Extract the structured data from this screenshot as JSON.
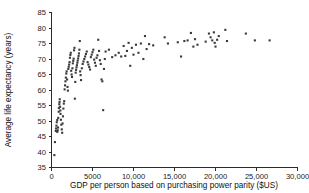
{
  "chart_data": {
    "type": "scatter",
    "title": "",
    "xlabel": "GDP per person based on purchasing power parity ($US)",
    "ylabel": "Average life expectancy (years)",
    "xlim": [
      0,
      30000
    ],
    "ylim": [
      35,
      85
    ],
    "grid": false,
    "legend": null,
    "xticks": [
      0,
      5000,
      10000,
      15000,
      20000,
      25000,
      30000
    ],
    "xticklabels": [
      "0",
      "5000",
      "10,000",
      "15,000",
      "20,000",
      "25,000",
      "30,000"
    ],
    "yticks": [
      35,
      40,
      45,
      50,
      55,
      60,
      65,
      70,
      75,
      80,
      85
    ],
    "yticklabels": [
      "35",
      "40",
      "45",
      "50",
      "55",
      "60",
      "65",
      "70",
      "75",
      "80",
      "85"
    ],
    "marker": {
      "shape": "square",
      "color": "#3a3a3a",
      "size_px": 2.1
    },
    "series": [
      {
        "name": "Countries",
        "points": [
          [
            350,
            39.0
          ],
          [
            420,
            43.2
          ],
          [
            520,
            46.8
          ],
          [
            560,
            47.6
          ],
          [
            600,
            48.5
          ],
          [
            640,
            49.6
          ],
          [
            700,
            50.3
          ],
          [
            700,
            46.5
          ],
          [
            760,
            47.0
          ],
          [
            800,
            47.9
          ],
          [
            820,
            51.0
          ],
          [
            880,
            53.0
          ],
          [
            900,
            54.2
          ],
          [
            950,
            55.4
          ],
          [
            980,
            56.1
          ],
          [
            1000,
            57.0
          ],
          [
            1050,
            54.6
          ],
          [
            1080,
            53.4
          ],
          [
            1100,
            52.3
          ],
          [
            1150,
            50.4
          ],
          [
            1200,
            48.8
          ],
          [
            1250,
            47.3
          ],
          [
            1300,
            46.2
          ],
          [
            1350,
            49.2
          ],
          [
            1400,
            51.5
          ],
          [
            1450,
            54.0
          ],
          [
            1500,
            55.6
          ],
          [
            1550,
            56.4
          ],
          [
            1600,
            60.2
          ],
          [
            1650,
            61.5
          ],
          [
            1700,
            62.8
          ],
          [
            1750,
            64.0
          ],
          [
            1800,
            65.3
          ],
          [
            1850,
            66.0
          ],
          [
            1900,
            63.4
          ],
          [
            1950,
            61.0
          ],
          [
            2000,
            59.8
          ],
          [
            2050,
            66.8
          ],
          [
            2100,
            67.5
          ],
          [
            2150,
            68.2
          ],
          [
            2200,
            69.0
          ],
          [
            2250,
            70.4
          ],
          [
            2300,
            71.3
          ],
          [
            2350,
            72.0
          ],
          [
            2400,
            66.2
          ],
          [
            2450,
            65.0
          ],
          [
            2500,
            64.2
          ],
          [
            2550,
            67.0
          ],
          [
            2600,
            68.6
          ],
          [
            2650,
            69.4
          ],
          [
            2700,
            70.1
          ],
          [
            2750,
            72.8
          ],
          [
            2800,
            73.6
          ],
          [
            2850,
            57.2
          ],
          [
            2900,
            62.6
          ],
          [
            2950,
            65.6
          ],
          [
            3000,
            66.5
          ],
          [
            3050,
            67.3
          ],
          [
            3100,
            68.0
          ],
          [
            3150,
            68.8
          ],
          [
            3200,
            69.5
          ],
          [
            3250,
            70.2
          ],
          [
            3300,
            71.0
          ],
          [
            3350,
            71.8
          ],
          [
            3400,
            73.0
          ],
          [
            3450,
            75.8
          ],
          [
            3500,
            66.0
          ],
          [
            3550,
            64.8
          ],
          [
            3600,
            63.2
          ],
          [
            3700,
            67.0
          ],
          [
            3800,
            68.4
          ],
          [
            3900,
            69.2
          ],
          [
            4000,
            70.0
          ],
          [
            4100,
            70.8
          ],
          [
            4200,
            71.6
          ],
          [
            4300,
            72.4
          ],
          [
            4400,
            69.0
          ],
          [
            4500,
            68.2
          ],
          [
            4600,
            67.4
          ],
          [
            4700,
            66.6
          ],
          [
            4800,
            70.6
          ],
          [
            4900,
            71.4
          ],
          [
            5000,
            72.2
          ],
          [
            5100,
            73.0
          ],
          [
            5200,
            69.8
          ],
          [
            5300,
            68.8
          ],
          [
            5400,
            67.8
          ],
          [
            5500,
            70.4
          ],
          [
            5600,
            71.2
          ],
          [
            5700,
            76.2
          ],
          [
            5800,
            72.6
          ],
          [
            5900,
            69.6
          ],
          [
            6000,
            68.4
          ],
          [
            6100,
            63.4
          ],
          [
            6200,
            62.8
          ],
          [
            6300,
            53.5
          ],
          [
            6400,
            66.8
          ],
          [
            6500,
            70.0
          ],
          [
            6600,
            72.4
          ],
          [
            7000,
            73.0
          ],
          [
            7400,
            70.6
          ],
          [
            7800,
            71.2
          ],
          [
            8200,
            72.0
          ],
          [
            8500,
            70.8
          ],
          [
            8800,
            74.2
          ],
          [
            9000,
            71.0
          ],
          [
            9200,
            72.6
          ],
          [
            9400,
            75.2
          ],
          [
            9600,
            67.8
          ],
          [
            9800,
            73.6
          ],
          [
            10000,
            71.4
          ],
          [
            10300,
            74.6
          ],
          [
            10600,
            72.0
          ],
          [
            10900,
            75.0
          ],
          [
            11200,
            70.0
          ],
          [
            11400,
            77.4
          ],
          [
            11600,
            73.2
          ],
          [
            11900,
            74.8
          ],
          [
            12400,
            74.4
          ],
          [
            13800,
            77.0
          ],
          [
            14200,
            75.0
          ],
          [
            15400,
            75.4
          ],
          [
            15800,
            70.8
          ],
          [
            16200,
            75.8
          ],
          [
            16600,
            76.0
          ],
          [
            17000,
            78.4
          ],
          [
            17300,
            74.0
          ],
          [
            17500,
            76.4
          ],
          [
            17800,
            74.6
          ],
          [
            18800,
            75.6
          ],
          [
            19200,
            78.2
          ],
          [
            19400,
            77.0
          ],
          [
            19600,
            76.0
          ],
          [
            19800,
            78.6
          ],
          [
            19900,
            75.2
          ],
          [
            20000,
            74.0
          ],
          [
            20200,
            76.2
          ],
          [
            20400,
            77.4
          ],
          [
            21200,
            79.4
          ],
          [
            21400,
            75.8
          ],
          [
            23700,
            78.2
          ],
          [
            24800,
            76.0
          ],
          [
            26600,
            76.0
          ]
        ]
      }
    ]
  },
  "axes": {
    "x_title": "GDP per person based on purchasing power parity ($US)",
    "y_title": "Average life expectancy (years)"
  }
}
